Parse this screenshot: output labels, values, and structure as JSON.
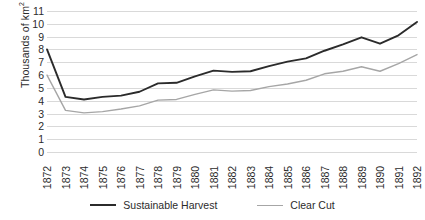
{
  "chart_data": {
    "type": "line",
    "title": "",
    "xlabel": "",
    "ylabel": "Thousands of km²",
    "ylabel_prefix": "Thousands of km",
    "ylabel_superscript": "2",
    "grid": true,
    "legend_position": "bottom",
    "ylim": [
      0,
      11
    ],
    "y_ticks": [
      0,
      1,
      2,
      3,
      4,
      5,
      6,
      7,
      8,
      9,
      10,
      11
    ],
    "y_tick_labels": [
      "0",
      "1",
      "2",
      "3",
      "4",
      "5",
      "6",
      "7",
      "8",
      "9",
      "10",
      "11"
    ],
    "categories": [
      "1872",
      "1873",
      "1874",
      "1875",
      "1876",
      "1877",
      "1878",
      "1879",
      "1880",
      "1881",
      "1882",
      "1883",
      "1884",
      "1885",
      "1886",
      "1887",
      "1888",
      "1889",
      "1890",
      "1891",
      "1892"
    ],
    "series": [
      {
        "name": "Sustainable Harvest",
        "color": "#2b2b2b",
        "values": [
          8.0,
          4.3,
          4.1,
          4.3,
          4.4,
          4.7,
          5.35,
          5.4,
          5.9,
          6.35,
          6.25,
          6.3,
          6.7,
          7.05,
          7.3,
          7.9,
          8.4,
          8.95,
          8.45,
          9.1,
          10.15
        ]
      },
      {
        "name": "Clear Cut",
        "color": "#a6a6a6",
        "values": [
          6.0,
          3.25,
          3.05,
          3.15,
          3.35,
          3.6,
          4.05,
          4.1,
          4.5,
          4.85,
          4.75,
          4.8,
          5.1,
          5.3,
          5.6,
          6.1,
          6.3,
          6.65,
          6.3,
          6.9,
          7.6
        ]
      }
    ]
  },
  "legend": {
    "items": [
      {
        "label": "Sustainable Harvest",
        "color": "#2b2b2b"
      },
      {
        "label": "Clear Cut",
        "color": "#a6a6a6"
      }
    ]
  },
  "colors": {
    "sustainable_harvest": "#2b2b2b",
    "clear_cut": "#a6a6a6",
    "gridline": "#d9d9d9",
    "text": "#2b2b2b",
    "background": "#ffffff"
  }
}
